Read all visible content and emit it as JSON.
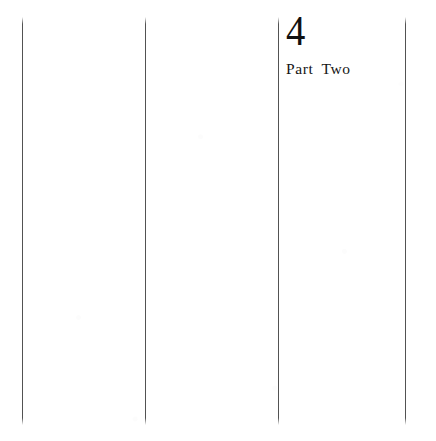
{
  "page": {
    "kind": "scanned-book-page",
    "width": 436,
    "height": 441,
    "background_color": "#ffffff",
    "ink_color": "#111111",
    "rule_color": "#3b3b3b"
  },
  "heading": {
    "chapter_number": "4",
    "part_label": "Part Two"
  },
  "column_rules": [
    {
      "name": "column-rule-1",
      "x": 22,
      "y_top": 17,
      "y_bottom": 425
    },
    {
      "name": "column-rule-2",
      "x": 145,
      "y_top": 17,
      "y_bottom": 425
    },
    {
      "name": "column-rule-3",
      "x": 278,
      "y_top": 17,
      "y_bottom": 425
    },
    {
      "name": "column-rule-4",
      "x": 405,
      "y_top": 17,
      "y_bottom": 425
    }
  ]
}
